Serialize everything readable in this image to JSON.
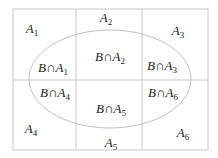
{
  "diagram": {
    "type": "venn-partition",
    "colors": {
      "grid": "#c8c8c8",
      "ellipse": "#c0c0c0",
      "text": "#222222",
      "background": "#ffffff"
    },
    "grid": {
      "left": 13,
      "top": 9,
      "right": 208,
      "bottom": 150,
      "v1": 76,
      "v2": 142,
      "hmid": 80
    },
    "ellipse": {
      "cx": 110,
      "cy": 79,
      "rx": 81,
      "ry": 49
    },
    "regions": [
      {
        "id": "A1",
        "base": "A",
        "sub": "1",
        "x": 32,
        "y": 30
      },
      {
        "id": "A2",
        "base": "A",
        "sub": "2",
        "x": 106,
        "y": 19
      },
      {
        "id": "A3",
        "base": "A",
        "sub": "3",
        "x": 178,
        "y": 32
      },
      {
        "id": "A4",
        "base": "A",
        "sub": "4",
        "x": 31,
        "y": 130
      },
      {
        "id": "A5",
        "base": "A",
        "sub": "5",
        "x": 111,
        "y": 144
      },
      {
        "id": "A6",
        "base": "A",
        "sub": "6",
        "x": 183,
        "y": 134
      }
    ],
    "intersections": [
      {
        "id": "B∩A1",
        "prefix": "B∩A",
        "sub": "1",
        "x": 53,
        "y": 69
      },
      {
        "id": "B∩A2",
        "prefix": "B∩A",
        "sub": "2",
        "x": 110,
        "y": 58
      },
      {
        "id": "B∩A3",
        "prefix": "B∩A",
        "sub": "3",
        "x": 162,
        "y": 67
      },
      {
        "id": "B∩A4",
        "prefix": "B∩A",
        "sub": "4",
        "x": 55,
        "y": 94
      },
      {
        "id": "B∩A5",
        "prefix": "B∩A",
        "sub": "5",
        "x": 111,
        "y": 110
      },
      {
        "id": "B∩A6",
        "prefix": "B∩A",
        "sub": "6",
        "x": 163,
        "y": 94
      }
    ]
  }
}
